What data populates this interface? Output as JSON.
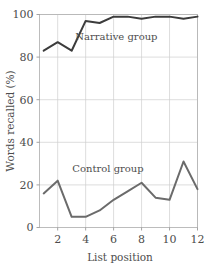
{
  "chart_data": {
    "type": "line",
    "title": "",
    "xlabel": "List position",
    "ylabel": "Words recalled (%)",
    "xlim": [
      0.7,
      12.0
    ],
    "ylim": [
      0,
      100
    ],
    "grid": true,
    "legend_position": "inline-annotations",
    "x": [
      1,
      2,
      3,
      4,
      5,
      6,
      7,
      8,
      9,
      10,
      11,
      12
    ],
    "xticks": [
      2,
      4,
      6,
      8,
      10,
      12
    ],
    "xtick_labels": [
      "2",
      "4",
      "6",
      "8",
      "10",
      "12"
    ],
    "yticks": [
      0,
      20,
      40,
      60,
      80,
      100
    ],
    "ytick_labels": [
      "0",
      "20",
      "40",
      "60",
      "80",
      "100"
    ],
    "series": [
      {
        "name": "Narrative group",
        "color": "#3c3c3c",
        "values": [
          83,
          87,
          83,
          97,
          96,
          99,
          99,
          98,
          99,
          99,
          98,
          99
        ],
        "annotation": {
          "text": "Narrative group",
          "x": 6.2,
          "y": 88
        }
      },
      {
        "name": "Control group",
        "color": "#6b6b6b",
        "values": [
          16,
          22,
          5,
          5,
          8,
          13,
          17,
          21,
          14,
          13,
          31,
          18
        ],
        "annotation": {
          "text": "Control group",
          "x": 5.6,
          "y": 26
        }
      }
    ],
    "annotations": [
      {
        "text": "Narrative group",
        "x": 6.2,
        "y": 88
      },
      {
        "text": "Control group",
        "x": 5.6,
        "y": 26
      }
    ],
    "colors": {
      "narrative": "#3c3c3c",
      "control": "#6b6b6b",
      "gridline": "#cfcfcf",
      "frame": "#b5b5b5",
      "text": "#4d4d4d",
      "background": "#ffffff"
    }
  }
}
